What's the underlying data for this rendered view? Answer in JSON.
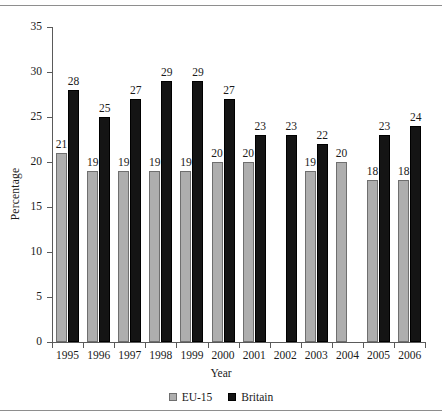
{
  "chart_data": {
    "type": "bar",
    "title": "",
    "xlabel": "Year",
    "ylabel": "Percentage",
    "categories": [
      "1995",
      "1996",
      "1997",
      "1998",
      "1999",
      "2000",
      "2001",
      "2002",
      "2003",
      "2004",
      "2005",
      "2006"
    ],
    "series": [
      {
        "name": "EU-15",
        "color": "#aeaeae",
        "values": [
          21,
          19,
          19,
          19,
          19,
          20,
          20,
          null,
          19,
          20,
          18,
          18
        ]
      },
      {
        "name": "Britain",
        "color": "#141414",
        "values": [
          28,
          25,
          27,
          29,
          29,
          27,
          23,
          23,
          22,
          null,
          23,
          24
        ]
      }
    ],
    "ylim": [
      0,
      35
    ],
    "ytick_step": 5,
    "yticks": [
      "0",
      "5",
      "10",
      "15",
      "20",
      "25",
      "30",
      "35"
    ],
    "grid": false,
    "legend_position": "bottom",
    "data_labels": true
  },
  "legend": {
    "items": [
      {
        "label": "EU-15",
        "swatch": "grey-square-icon"
      },
      {
        "label": "Britain",
        "swatch": "black-square-icon"
      }
    ]
  }
}
